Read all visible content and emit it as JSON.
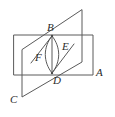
{
  "figure": {
    "type": "geometry-diagram",
    "background_color": "#ffffff",
    "stroke_color": "#5a5a5a",
    "label_color": "#2b2b2b",
    "labels": [
      {
        "id": "label-B",
        "text": "B",
        "x": 47,
        "y": 22
      },
      {
        "id": "label-E",
        "text": "E",
        "x": 62,
        "y": 41
      },
      {
        "id": "label-F",
        "text": "F",
        "x": 35,
        "y": 52
      },
      {
        "id": "label-D",
        "text": "D",
        "x": 53,
        "y": 75
      },
      {
        "id": "label-A",
        "text": "A",
        "x": 96,
        "y": 67
      },
      {
        "id": "label-C",
        "text": "C",
        "x": 10,
        "y": 94
      }
    ],
    "shapes": {
      "horizontal_plane": {
        "name": "rectangle-plane-A",
        "points": "14,35 93,35 93,75 14,75"
      },
      "tilted_plane": {
        "name": "parallelogram-plane-C",
        "points": "82,10 82,62 22,97 22,50"
      },
      "segment_BD": {
        "name": "segment-bd",
        "x1": 52,
        "y1": 36,
        "x2": 52,
        "y2": 73
      },
      "arc_left": {
        "name": "arc-left-bd",
        "d": "M 52 36 C 43 47 43 62 52 73"
      },
      "arc_right": {
        "name": "arc-right-bd",
        "d": "M 52 36 C 61 47 61 62 52 73"
      },
      "segment_BF_left": {
        "name": "segment-b-to-lower-left",
        "x1": 52,
        "y1": 36,
        "x2": 31,
        "y2": 63
      },
      "segment_DE_right": {
        "name": "segment-d-to-upper-right",
        "x1": 52,
        "y1": 73,
        "x2": 74,
        "y2": 44
      }
    },
    "points": [
      {
        "name": "point-B",
        "x": 52,
        "y": 36
      },
      {
        "name": "point-D",
        "x": 52,
        "y": 73
      }
    ]
  }
}
